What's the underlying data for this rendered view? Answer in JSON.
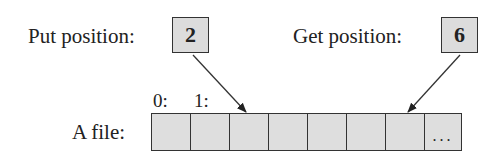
{
  "put": {
    "label": "Put position:",
    "value": "2"
  },
  "get": {
    "label": "Get position:",
    "value": "6"
  },
  "file": {
    "label": "A file:",
    "indices": [
      "0:",
      "1:"
    ],
    "cell_count": 8,
    "ellipsis": "..."
  },
  "colors": {
    "cell_fill": "#dedede",
    "box_fill": "#dcdcdc",
    "stroke": "#333333"
  }
}
